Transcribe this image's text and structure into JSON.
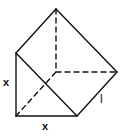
{
  "figure": {
    "type": "triangular-prism",
    "labels": {
      "left_edge": "x",
      "bottom_edge": "x",
      "length_edge": "l"
    },
    "stroke_color": "#111111",
    "background": "#ffffff"
  }
}
